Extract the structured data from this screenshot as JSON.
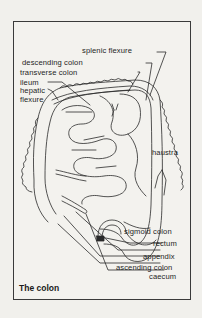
{
  "figure": {
    "title": "The colon",
    "labels": {
      "splenic_flexure": "splenic flexure",
      "descending_colon": "descending colon",
      "transverse_colon": "transverse colon",
      "ileum": "ileum",
      "hepatic_flexure_1": "hepatic",
      "hepatic_flexure_2": "flexure",
      "haustra": "haustra",
      "sigmoid_colon": "sigmoid colon",
      "rectum": "rectum",
      "appendix": "appendix",
      "ascending_colon": "ascending colon",
      "caecum": "caecum"
    },
    "colors": {
      "background": "#f1f0ec",
      "line": "#2a2a2a",
      "text": "#1e1e1e"
    }
  }
}
